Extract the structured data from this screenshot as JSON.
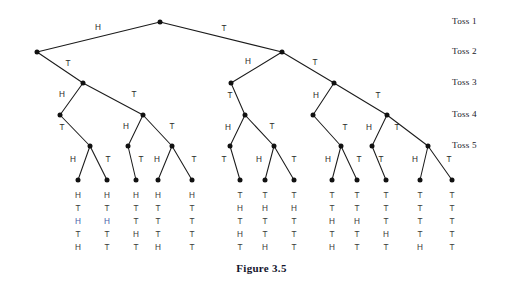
{
  "figure": {
    "caption": "Figure 3.5"
  },
  "stage_labels": [
    {
      "id": "toss-1",
      "text": "Toss 1",
      "x": 452,
      "y": 22
    },
    {
      "id": "toss-2",
      "text": "Toss 2",
      "x": 452,
      "y": 52
    },
    {
      "id": "toss-3",
      "text": "Toss 3",
      "x": 452,
      "y": 83
    },
    {
      "id": "toss-4",
      "text": "Toss 4",
      "x": 452,
      "y": 115
    },
    {
      "id": "toss-5",
      "text": "Toss 5",
      "x": 452,
      "y": 146
    }
  ],
  "chart_data": {
    "type": "diagram",
    "title": "Figure 3.5",
    "stages": [
      "Toss 1",
      "Toss 2",
      "Toss 3",
      "Toss 4",
      "Toss 5"
    ],
    "branch_labels": [
      "H",
      "T"
    ],
    "leaf_count": 13,
    "nodes": [
      {
        "id": "root",
        "x": 160,
        "y": 22
      },
      {
        "id": "n-H",
        "x": 37,
        "y": 52
      },
      {
        "id": "n-T",
        "x": 282,
        "y": 52
      },
      {
        "id": "n-HT",
        "x": 83,
        "y": 83
      },
      {
        "id": "n-TH",
        "x": 231,
        "y": 83
      },
      {
        "id": "n-TT",
        "x": 334,
        "y": 83
      },
      {
        "id": "n-HTH",
        "x": 60,
        "y": 115
      },
      {
        "id": "n-HTT",
        "x": 143,
        "y": 115
      },
      {
        "id": "n-THH",
        "x": 245,
        "y": 115
      },
      {
        "id": "n-TTH",
        "x": 313,
        "y": 115
      },
      {
        "id": "n-TTT",
        "x": 387,
        "y": 115
      },
      {
        "id": "n-HTHT",
        "x": 90,
        "y": 146
      },
      {
        "id": "n-HTTH",
        "x": 128,
        "y": 146
      },
      {
        "id": "n-HTTT",
        "x": 172,
        "y": 146
      },
      {
        "id": "n-THHT",
        "x": 230,
        "y": 146
      },
      {
        "id": "n-THTT",
        "x": 274,
        "y": 146
      },
      {
        "id": "n-TTHT",
        "x": 341,
        "y": 146
      },
      {
        "id": "n-TTTH",
        "x": 372,
        "y": 146
      },
      {
        "id": "n-TTTT",
        "x": 428,
        "y": 146
      }
    ],
    "edges": [
      {
        "from": "root",
        "to": "n-H",
        "label": "H",
        "lx": 98,
        "ly": 28
      },
      {
        "from": "root",
        "to": "n-T",
        "label": "T",
        "lx": 224,
        "ly": 29
      },
      {
        "from": "n-H",
        "to": "n-HT",
        "label": "T",
        "lx": 68,
        "ly": 64
      },
      {
        "from": "n-T",
        "to": "n-TH",
        "label": "H",
        "lx": 248,
        "ly": 62
      },
      {
        "from": "n-T",
        "to": "n-TT",
        "label": "T",
        "lx": 315,
        "ly": 63
      },
      {
        "from": "n-HT",
        "to": "n-HTH",
        "label": "H",
        "lx": 62,
        "ly": 95
      },
      {
        "from": "n-HT",
        "to": "n-HTT",
        "label": "T",
        "lx": 134,
        "ly": 95
      },
      {
        "from": "n-TH",
        "to": "n-THH",
        "label": "T",
        "lx": 230,
        "ly": 96
      },
      {
        "from": "n-TT",
        "to": "n-TTH",
        "label": "H",
        "lx": 316,
        "ly": 96
      },
      {
        "from": "n-TT",
        "to": "n-TTT",
        "label": "T",
        "lx": 378,
        "ly": 96
      },
      {
        "from": "n-HTH",
        "to": "n-HTHT",
        "label": "T",
        "lx": 62,
        "ly": 128
      },
      {
        "from": "n-HTT",
        "to": "n-HTTH",
        "label": "H",
        "lx": 126,
        "ly": 127
      },
      {
        "from": "n-HTT",
        "to": "n-HTTT",
        "label": "T",
        "lx": 172,
        "ly": 127
      },
      {
        "from": "n-THH",
        "to": "n-THHT",
        "label": "H",
        "lx": 228,
        "ly": 128
      },
      {
        "from": "n-THH",
        "to": "n-THTT",
        "label": "T",
        "lx": 272,
        "ly": 127
      },
      {
        "from": "n-TTH",
        "to": "n-TTHT",
        "label": "T",
        "lx": 345,
        "ly": 128
      },
      {
        "from": "n-TTT",
        "to": "n-TTTH",
        "label": "H",
        "lx": 369,
        "ly": 128
      },
      {
        "from": "n-TTT",
        "to": "n-TTTT",
        "label": "T",
        "lx": 397,
        "ly": 128
      },
      {
        "from": "n-HTHT",
        "to": "leaf-1",
        "label": "H",
        "lx": 73,
        "ly": 160
      },
      {
        "from": "n-HTHT",
        "to": "leaf-2",
        "label": "T",
        "lx": 108,
        "ly": 160
      },
      {
        "from": "n-HTTH",
        "to": "leaf-3",
        "label": "T",
        "lx": 141,
        "ly": 160
      },
      {
        "from": "n-HTTT",
        "to": "leaf-4",
        "label": "H",
        "lx": 157,
        "ly": 160
      },
      {
        "from": "n-HTTT",
        "to": "leaf-5",
        "label": "T",
        "lx": 194,
        "ly": 160
      },
      {
        "from": "n-THHT",
        "to": "leaf-6",
        "label": "T",
        "lx": 224,
        "ly": 160
      },
      {
        "from": "n-THTT",
        "to": "leaf-7",
        "label": "H",
        "lx": 259,
        "ly": 160
      },
      {
        "from": "n-THTT",
        "to": "leaf-8",
        "label": "T",
        "lx": 294,
        "ly": 160
      },
      {
        "from": "n-TTHT",
        "to": "leaf-9",
        "label": "H",
        "lx": 328,
        "ly": 160
      },
      {
        "from": "n-TTHT",
        "to": "leaf-10",
        "label": "T",
        "lx": 359,
        "ly": 160
      },
      {
        "from": "n-TTTH",
        "to": "leaf-11",
        "label": "T",
        "lx": 381,
        "ly": 160
      },
      {
        "from": "n-TTTT",
        "to": "leaf-12",
        "label": "H",
        "lx": 415,
        "ly": 160
      },
      {
        "from": "n-TTTT",
        "to": "leaf-13",
        "label": "T",
        "lx": 449,
        "ly": 160
      }
    ],
    "leaves": [
      {
        "id": "leaf-1",
        "x": 78,
        "y": 180,
        "sequence": [
          "H",
          "T",
          "H",
          "T",
          "H"
        ],
        "accent_index": 2
      },
      {
        "id": "leaf-2",
        "x": 107,
        "y": 180,
        "sequence": [
          "H",
          "T",
          "H",
          "T",
          "T"
        ],
        "accent_index": 2
      },
      {
        "id": "leaf-3",
        "x": 136,
        "y": 180,
        "sequence": [
          "H",
          "T",
          "T",
          "H",
          "T"
        ],
        "accent_index": -1
      },
      {
        "id": "leaf-4",
        "x": 158,
        "y": 180,
        "sequence": [
          "H",
          "T",
          "T",
          "T",
          "H"
        ],
        "accent_index": -1
      },
      {
        "id": "leaf-5",
        "x": 192,
        "y": 180,
        "sequence": [
          "H",
          "T",
          "T",
          "T",
          "T"
        ],
        "accent_index": -1
      },
      {
        "id": "leaf-6",
        "x": 240,
        "y": 180,
        "sequence": [
          "T",
          "H",
          "T",
          "H",
          "T"
        ],
        "accent_index": -1
      },
      {
        "id": "leaf-7",
        "x": 265,
        "y": 180,
        "sequence": [
          "T",
          "H",
          "T",
          "T",
          "H"
        ],
        "accent_index": -1
      },
      {
        "id": "leaf-8",
        "x": 294,
        "y": 180,
        "sequence": [
          "T",
          "H",
          "T",
          "T",
          "T"
        ],
        "accent_index": -1
      },
      {
        "id": "leaf-9",
        "x": 332,
        "y": 180,
        "sequence": [
          "T",
          "T",
          "H",
          "T",
          "H"
        ],
        "accent_index": -1
      },
      {
        "id": "leaf-10",
        "x": 357,
        "y": 180,
        "sequence": [
          "T",
          "T",
          "H",
          "T",
          "T"
        ],
        "accent_index": -1
      },
      {
        "id": "leaf-11",
        "x": 386,
        "y": 180,
        "sequence": [
          "T",
          "T",
          "T",
          "H",
          "T"
        ],
        "accent_index": -1
      },
      {
        "id": "leaf-12",
        "x": 420,
        "y": 180,
        "sequence": [
          "T",
          "T",
          "T",
          "T",
          "H"
        ],
        "accent_index": -1
      },
      {
        "id": "leaf-13",
        "x": 452,
        "y": 180,
        "sequence": [
          "T",
          "T",
          "T",
          "T",
          "T"
        ],
        "accent_index": -1
      }
    ],
    "leaf_text_rows_y": [
      196,
      209,
      222,
      235,
      248
    ],
    "colors": {
      "line": "#1b1b1b",
      "node": "#111111",
      "label": "#2a2a2a",
      "accent": "#4a5da8",
      "caption": "#14142c",
      "background": "#ffffff"
    }
  }
}
